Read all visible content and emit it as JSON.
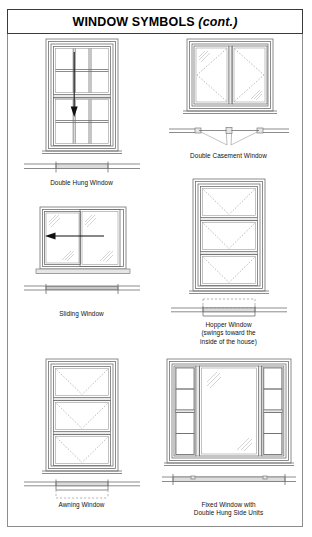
{
  "document": {
    "title_main": "WINDOW SYMBOLS",
    "title_cont": "(cont.)"
  },
  "figures": [
    {
      "id": "double-hung-window",
      "caption": "Double Hung Window",
      "caption_sub": "",
      "view": "elevation-and-plan",
      "panes_across": 3,
      "panes_down": 4,
      "sashes": 2,
      "operation_indicator": "down-arrow",
      "symbol_type": "double-hung"
    },
    {
      "id": "double-casement-window",
      "caption": "Double Casement Window",
      "caption_sub": "",
      "view": "elevation-and-plan",
      "leaves": 2,
      "operation_indicator": "diagonal-swing-lines",
      "symbol_type": "casement"
    },
    {
      "id": "sliding-window",
      "caption": "Sliding Window",
      "caption_sub": "",
      "view": "elevation-and-plan",
      "leaves": 2,
      "operation_indicator": "left-arrow",
      "symbol_type": "slider"
    },
    {
      "id": "hopper-window",
      "caption": "Hopper Window",
      "caption_sub_1": "(swings toward the",
      "caption_sub_2": "inside of the house)",
      "view": "elevation-and-plan",
      "sashes": 3,
      "operation_indicator": "v-dashed-swing",
      "swing_direction": "inward",
      "symbol_type": "hopper"
    },
    {
      "id": "awning-window",
      "caption": "Awning Window",
      "caption_sub": "",
      "view": "elevation-and-plan",
      "sashes": 3,
      "operation_indicator": "v-dashed-swing",
      "swing_direction": "outward",
      "symbol_type": "awning"
    },
    {
      "id": "fixed-window-double-hung-side-units",
      "caption": "Fixed Window with",
      "caption_sub": "Double Hung Side Units",
      "view": "elevation-and-plan",
      "side_units": 2,
      "side_unit_panes": 4,
      "center": "fixed-glass",
      "operation_indicator": "glass-hatch",
      "symbol_type": "fixed-with-double-hung"
    }
  ],
  "colors": {
    "ink": "#1a1a1a",
    "line": "#6f6f6f",
    "frame": "#8d8d8d",
    "fill": "#e6e6e6",
    "arrow": "#111111"
  }
}
